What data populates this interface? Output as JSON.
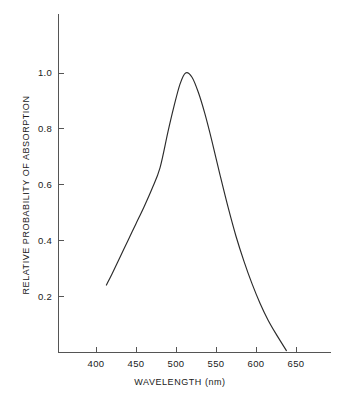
{
  "chart_data": {
    "type": "line",
    "title": "",
    "xlabel": "WAVELENGTH (nm)",
    "ylabel": "RELATIVE PROBABILITY OF ABSORPTION",
    "xlabel_main": "WAVELENGTH",
    "xlabel_unit": "(nm)",
    "xlim": [
      365,
      682
    ],
    "ylim": [
      0.0,
      1.07
    ],
    "grid": false,
    "legend": null,
    "legend_position": "none",
    "xticks": [
      400,
      450,
      500,
      550,
      600,
      650
    ],
    "xtick_labels": [
      "400",
      "450",
      "500",
      "550",
      "600",
      "650"
    ],
    "yticks": [
      0.2,
      0.4,
      0.6,
      0.8,
      1.0
    ],
    "ytick_labels": [
      "0.2",
      "0.4",
      "0.6",
      "0.8",
      "1.0"
    ],
    "series": [
      {
        "name": "absorption",
        "color": "#2b2b2b",
        "x": [
          413,
          420,
          430,
          440,
          450,
          460,
          470,
          480,
          490,
          497,
          505,
          512,
          520,
          528,
          536,
          545,
          555,
          565,
          575,
          585,
          595,
          605,
          615,
          625,
          638
        ],
        "y": [
          0.24,
          0.28,
          0.34,
          0.4,
          0.46,
          0.52,
          0.585,
          0.66,
          0.79,
          0.875,
          0.96,
          1.0,
          0.985,
          0.93,
          0.855,
          0.755,
          0.635,
          0.52,
          0.415,
          0.325,
          0.245,
          0.175,
          0.115,
          0.065,
          0.005
        ]
      }
    ],
    "peak": {
      "x": 512,
      "y": 1.0
    },
    "axis_color": "#555555"
  }
}
